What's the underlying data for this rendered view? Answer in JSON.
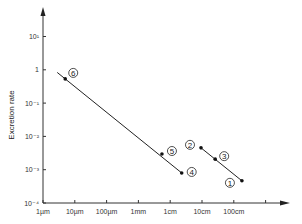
{
  "chart_data": {
    "type": "scatter",
    "title": "",
    "xlabel": "",
    "ylabel": "Excretion rate",
    "x_scale": "log",
    "y_scale": "log",
    "x_ticks": [
      "1µm",
      "10µm",
      "100µm",
      "1mm",
      "1cm",
      "10cm",
      "100cm",
      ""
    ],
    "y_ticks": [
      "10⁻⁴",
      "10⁻³",
      "10⁻²",
      "10⁻¹",
      "1",
      "10¹"
    ],
    "xlim_um": [
      1,
      10000000
    ],
    "ylim": [
      0.0001,
      10
    ],
    "grid": false,
    "legend": "none",
    "points": [
      {
        "id": "1",
        "x_um": 1800000,
        "x_label": "~180 cm",
        "y": 0.00047
      },
      {
        "id": "2",
        "x_um": 93000,
        "x_label": "~9 cm",
        "y": 0.0046
      },
      {
        "id": "3",
        "x_um": 260000,
        "x_label": "~26 cm",
        "y": 0.0021
      },
      {
        "id": "4",
        "x_um": 23000,
        "x_label": "~2.3 cm",
        "y": 0.00081
      },
      {
        "id": "5",
        "x_um": 5500,
        "x_label": "~5.5 mm",
        "y": 0.003
      },
      {
        "id": "6",
        "x_um": 5,
        "x_label": "~5 µm",
        "y": 0.54
      }
    ],
    "lines": [
      {
        "name": "fit-small",
        "through": [
          "6",
          "5",
          "4"
        ]
      },
      {
        "name": "fit-large",
        "through": [
          "2",
          "3",
          "1"
        ]
      }
    ]
  }
}
